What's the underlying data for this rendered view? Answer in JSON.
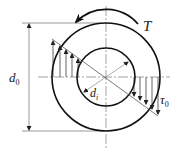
{
  "diagram": {
    "labels": {
      "torque": "T",
      "outer_diameter": "d",
      "outer_diameter_sub": "0",
      "inner_diameter": "d",
      "inner_diameter_sub": "i",
      "max_shear": "τ",
      "max_shear_sub": "0"
    },
    "colors": {
      "stroke": "#111111",
      "thin": "#555555",
      "background": "#ffffff"
    }
  }
}
